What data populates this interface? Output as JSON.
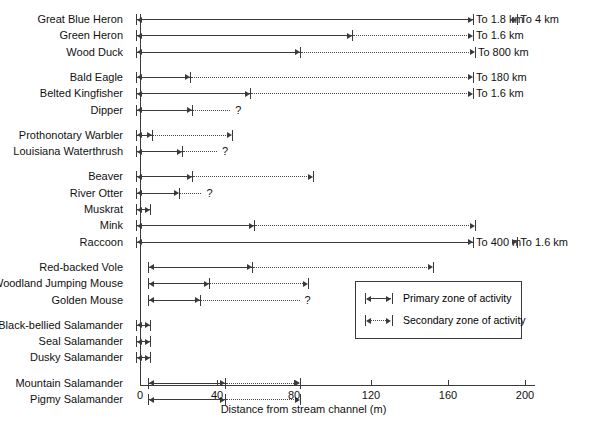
{
  "chart_data": {
    "type": "bar",
    "title": "",
    "xlabel": "Distance from stream channel (m)",
    "ylabel": "",
    "xlim": [
      0,
      210
    ],
    "xticks": [
      0,
      40,
      80,
      120,
      160,
      200
    ],
    "xticklabels": [
      "0",
      "40",
      "80",
      "120",
      "160",
      "200"
    ],
    "grid": false,
    "legend_position": "inside-lower-right",
    "legend": [
      {
        "label": "Primary zone of activity",
        "style": "solid"
      },
      {
        "label": "Secondary zone of activity",
        "style": "dotted"
      }
    ],
    "categories": [
      "Great Blue Heron",
      "Green Heron",
      "Wood Duck",
      "Bald Eagle",
      "Belted Kingfisher",
      "Dipper",
      "Prothonotary Warbler",
      "Louisiana Waterthrush",
      "Beaver",
      "River Otter",
      "Muskrat",
      "Mink",
      "Raccoon",
      "Red-backed Vole",
      "Woodland Jumping Mouse",
      "Golden Mouse",
      "Black-bellied Salamander",
      "Seal Salamander",
      "Dusky Salamander",
      "Mountain Salamander",
      "Pigmy Salamander"
    ],
    "rows": [
      {
        "label": "Great Blue Heron",
        "group": 0,
        "start": -2,
        "primary_end": 173,
        "secondary_end": 196,
        "primary_note": "To 1.8 km",
        "secondary_note": "To 4 km",
        "question": false
      },
      {
        "label": "Green Heron",
        "group": 0,
        "start": -2,
        "primary_end": 110,
        "secondary_end": 173,
        "primary_note": "",
        "secondary_note": "To 1.6 km",
        "question": false
      },
      {
        "label": "Wood Duck",
        "group": 0,
        "start": -2,
        "primary_end": 83,
        "secondary_end": 174,
        "primary_note": "",
        "secondary_note": "To 800 km",
        "question": false
      },
      {
        "label": "Bald Eagle",
        "group": 1,
        "start": -2,
        "primary_end": 26,
        "secondary_end": 173,
        "primary_note": "",
        "secondary_note": "To 180 km",
        "question": false
      },
      {
        "label": "Belted Kingfisher",
        "group": 1,
        "start": -2,
        "primary_end": 57,
        "secondary_end": 173,
        "primary_note": "",
        "secondary_note": "To 1.6 km",
        "question": false
      },
      {
        "label": "Dipper",
        "group": 1,
        "start": -2,
        "primary_end": 27,
        "secondary_end": 49,
        "primary_note": "",
        "secondary_note": "",
        "question": true
      },
      {
        "label": "Prothonotary Warbler",
        "group": 2,
        "start": -2,
        "primary_end": 6,
        "secondary_end": 48,
        "primary_note": "",
        "secondary_note": "",
        "question": false
      },
      {
        "label": "Louisiana Waterthrush",
        "group": 2,
        "start": -2,
        "primary_end": 22,
        "secondary_end": 42,
        "primary_note": "",
        "secondary_note": "",
        "question": true
      },
      {
        "label": "Beaver",
        "group": 3,
        "start": -2,
        "primary_end": 27,
        "secondary_end": 90,
        "primary_note": "",
        "secondary_note": "",
        "question": false
      },
      {
        "label": "River Otter",
        "group": 3,
        "start": -2,
        "primary_end": 20,
        "secondary_end": 34,
        "primary_note": "",
        "secondary_note": "",
        "question": true
      },
      {
        "label": "Muskrat",
        "group": 3,
        "start": -2,
        "primary_end": 5,
        "secondary_end": null,
        "primary_note": "",
        "secondary_note": "",
        "question": false
      },
      {
        "label": "Mink",
        "group": 3,
        "start": -2,
        "primary_end": 59,
        "secondary_end": 174,
        "primary_note": "",
        "secondary_note": "",
        "question": false
      },
      {
        "label": "Raccoon",
        "group": 3,
        "start": -2,
        "primary_end": 173,
        "secondary_end": 196,
        "primary_note": "To 400 m",
        "secondary_note": "To 1.6 km",
        "question": false
      },
      {
        "label": "Red-backed Vole",
        "group": 4,
        "start": 4,
        "primary_end": 58,
        "secondary_end": 152,
        "primary_note": "",
        "secondary_note": "",
        "question": false
      },
      {
        "label": "Woodland Jumping Mouse",
        "group": 4,
        "start": 4,
        "primary_end": 36,
        "secondary_end": 87,
        "primary_note": "",
        "secondary_note": "",
        "question": false
      },
      {
        "label": "Golden Mouse",
        "group": 4,
        "start": 4,
        "primary_end": 31,
        "secondary_end": 85,
        "primary_note": "",
        "secondary_note": "",
        "question": true
      },
      {
        "label": "Black-bellied Salamander",
        "group": 5,
        "start": -2,
        "primary_end": 5,
        "secondary_end": null,
        "primary_note": "",
        "secondary_note": "",
        "question": false
      },
      {
        "label": "Seal Salamander",
        "group": 5,
        "start": -2,
        "primary_end": 5,
        "secondary_end": null,
        "primary_note": "",
        "secondary_note": "",
        "question": false
      },
      {
        "label": "Dusky Salamander",
        "group": 5,
        "start": -2,
        "primary_end": 5,
        "secondary_end": null,
        "primary_note": "",
        "secondary_note": "",
        "question": false
      },
      {
        "label": "Mountain Salamander",
        "group": 6,
        "start": 4,
        "primary_end": 44,
        "secondary_end": 83,
        "primary_note": "",
        "secondary_note": "",
        "question": false
      },
      {
        "label": "Pigmy Salamander",
        "group": 6,
        "start": 4,
        "primary_end": 44,
        "secondary_end": 83,
        "primary_note": "",
        "secondary_note": "",
        "question": false
      }
    ]
  },
  "axis": {
    "x_title": "Distance from stream channel (m)",
    "tick_labels": [
      "0",
      "40",
      "80",
      "120",
      "160",
      "200"
    ]
  },
  "legend": {
    "primary_label": "Primary zone of activity",
    "secondary_label": "Secondary zone of activity"
  },
  "colors": {
    "line": "#3a3a3a",
    "text": "#111111",
    "background": "#ffffff"
  },
  "question_mark": "?"
}
